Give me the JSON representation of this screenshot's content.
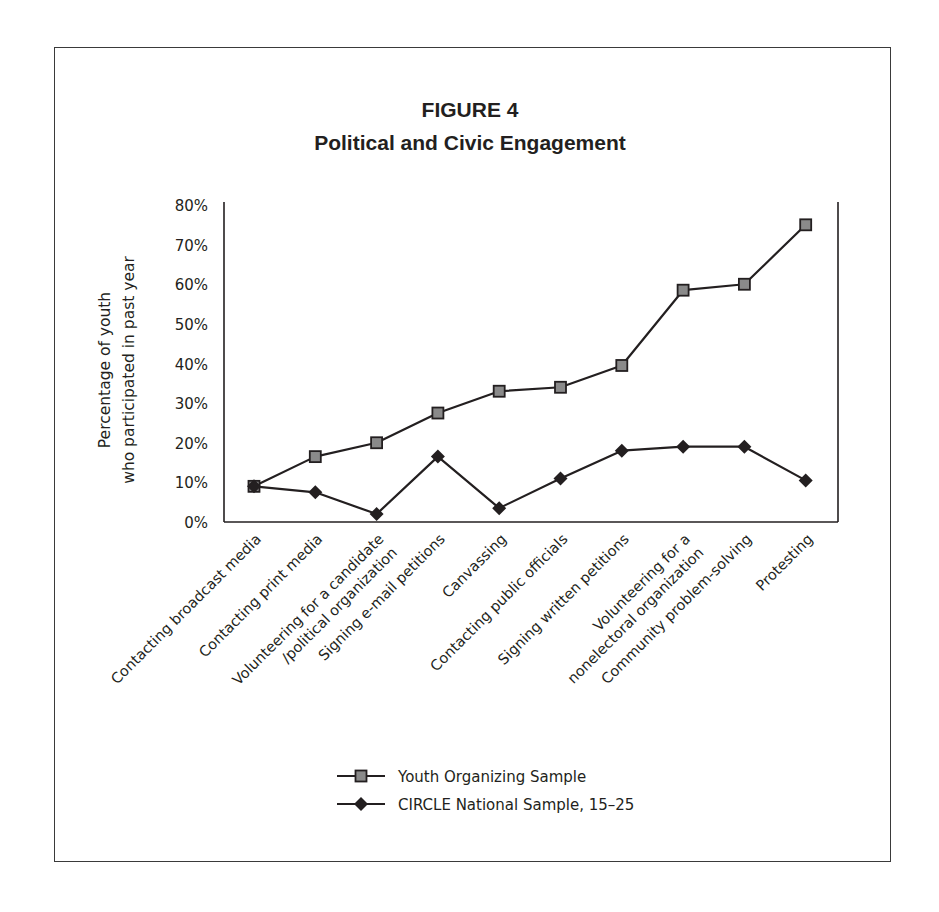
{
  "figure": {
    "label": "FIGURE 4",
    "title": "Political and Civic Engagement"
  },
  "chart_data": {
    "type": "line",
    "title": "Political and Civic Engagement",
    "figure_label": "FIGURE 4",
    "xlabel": "",
    "ylabel": "Percentage of youth who participated in past year",
    "ylabel_lines": [
      "Percentage of youth",
      "who participated in past year"
    ],
    "ylim": [
      0,
      80
    ],
    "yticks": [
      "0%",
      "10%",
      "20%",
      "30%",
      "40%",
      "50%",
      "60%",
      "70%",
      "80%"
    ],
    "grid": false,
    "legend_position": "bottom",
    "categories": [
      [
        "Contacting broadcast media"
      ],
      [
        "Contacting print media"
      ],
      [
        "Volunteering for a candidate",
        "/political organization"
      ],
      [
        "Signing e-mail petitions"
      ],
      [
        "Canvassing"
      ],
      [
        "Contacting public officials"
      ],
      [
        "Signing written petitions"
      ],
      [
        "Volunteering for a",
        "nonelectoral organization"
      ],
      [
        "Community problem-solving"
      ],
      [
        "Protesting"
      ]
    ],
    "series": [
      {
        "name": "Youth Organizing Sample",
        "marker": "square",
        "values": [
          9,
          16.5,
          20,
          27.5,
          33,
          34,
          39.5,
          58.5,
          60,
          75
        ]
      },
      {
        "name": "CIRCLE National Sample, 15–25",
        "marker": "diamond",
        "values": [
          9,
          7.5,
          2,
          16.5,
          3.5,
          11,
          18,
          19,
          19,
          10.5
        ]
      }
    ]
  },
  "colors": {
    "line": "#231f20",
    "square_fill": "#8a8a8a",
    "diamond_fill": "#231f20",
    "frame": "#3a3a3a"
  }
}
